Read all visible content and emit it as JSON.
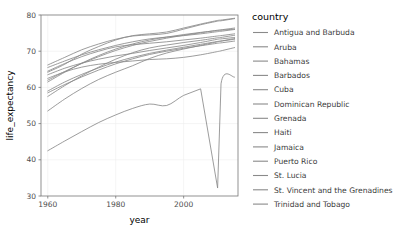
{
  "chart_data": {
    "type": "line",
    "title": "",
    "xlabel": "year",
    "ylabel": "life_expectancy",
    "xlim": [
      1958,
      2016
    ],
    "ylim": [
      30,
      80
    ],
    "xticks": [
      1960,
      1980,
      2000
    ],
    "yticks": [
      30,
      40,
      50,
      60,
      70,
      80
    ],
    "xtick_labels": [
      "1960",
      "1980",
      "2000"
    ],
    "ytick_labels": [
      "30",
      "40",
      "50",
      "60",
      "70",
      "80"
    ],
    "grid": true,
    "legend_position": "right",
    "legend_title": "country",
    "line_color": "#8a8a8a",
    "x": [
      1960,
      1965,
      1970,
      1975,
      1980,
      1985,
      1990,
      1995,
      2000,
      2005,
      2010,
      2011,
      2015
    ],
    "series": [
      {
        "name": "Antigua and Barbuda",
        "values": [
          62.0,
          64.4,
          66.6,
          68.5,
          70.2,
          71.6,
          72.7,
          73.6,
          74.4,
          75.1,
          75.8,
          75.9,
          76.4
        ]
      },
      {
        "name": "Aruba",
        "values": [
          65.5,
          67.3,
          69.0,
          70.4,
          71.6,
          72.6,
          73.4,
          73.9,
          74.3,
          74.8,
          75.4,
          75.5,
          76.0
        ]
      },
      {
        "name": "Bahamas",
        "values": [
          63.5,
          65.3,
          66.7,
          67.8,
          68.7,
          69.4,
          70.2,
          70.9,
          71.6,
          72.4,
          73.3,
          73.4,
          73.8
        ]
      },
      {
        "name": "Barbados",
        "values": [
          61.5,
          64.2,
          66.7,
          68.8,
          70.6,
          72.0,
          73.1,
          73.9,
          74.6,
          75.2,
          75.7,
          75.8,
          76.1
        ]
      },
      {
        "name": "Cuba",
        "values": [
          64.2,
          66.4,
          69.2,
          71.3,
          73.1,
          74.3,
          74.8,
          75.3,
          76.4,
          77.5,
          78.5,
          78.6,
          79.1
        ]
      },
      {
        "name": "Dominican Republic",
        "values": [
          53.5,
          56.8,
          59.7,
          62.2,
          64.2,
          66.0,
          68.0,
          69.5,
          70.6,
          71.6,
          72.6,
          72.8,
          73.5
        ]
      },
      {
        "name": "Grenada",
        "values": [
          59.0,
          61.5,
          63.6,
          65.4,
          67.0,
          68.3,
          69.4,
          70.3,
          71.1,
          71.9,
          72.7,
          72.8,
          73.3
        ]
      },
      {
        "name": "Haiti",
        "values": [
          42.5,
          45.2,
          47.8,
          50.3,
          52.4,
          54.2,
          55.4,
          55.0,
          57.8,
          59.6,
          32.2,
          61.0,
          62.8
        ]
      },
      {
        "name": "Jamaica",
        "values": [
          64.5,
          66.6,
          68.5,
          70.0,
          71.2,
          71.8,
          72.2,
          72.6,
          73.1,
          73.6,
          74.2,
          74.3,
          74.8
        ]
      },
      {
        "name": "Puerto Rico",
        "values": [
          66.2,
          68.3,
          70.4,
          72.0,
          73.3,
          74.2,
          74.5,
          74.9,
          76.1,
          77.3,
          78.3,
          78.4,
          79.0
        ]
      },
      {
        "name": "St. Lucia",
        "values": [
          57.5,
          60.5,
          63.2,
          65.6,
          67.8,
          69.6,
          70.9,
          71.7,
          72.4,
          73.0,
          73.7,
          73.8,
          74.4
        ]
      },
      {
        "name": "St. Vincent and the Grenadines",
        "values": [
          58.5,
          60.8,
          62.9,
          64.8,
          66.5,
          67.9,
          69.1,
          70.0,
          70.8,
          71.5,
          72.2,
          72.3,
          72.8
        ]
      },
      {
        "name": "Trinidad and Tobago",
        "values": [
          62.5,
          64.3,
          65.6,
          66.4,
          66.9,
          67.3,
          67.7,
          67.9,
          68.3,
          69.0,
          69.9,
          70.1,
          71.0
        ]
      }
    ]
  },
  "legend": {
    "title": "country",
    "items": [
      {
        "label": "Antigua and Barbuda"
      },
      {
        "label": "Aruba"
      },
      {
        "label": "Bahamas"
      },
      {
        "label": "Barbados"
      },
      {
        "label": "Cuba"
      },
      {
        "label": "Dominican Republic"
      },
      {
        "label": "Grenada"
      },
      {
        "label": "Haiti"
      },
      {
        "label": "Jamaica"
      },
      {
        "label": "Puerto Rico"
      },
      {
        "label": "St. Lucia"
      },
      {
        "label": "St. Vincent and the Grenadines"
      },
      {
        "label": "Trinidad and Tobago"
      }
    ]
  }
}
